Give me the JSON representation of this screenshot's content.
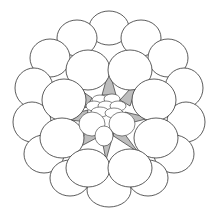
{
  "figure": {
    "colors": {
      "background": "#ffffff",
      "stroke": "#333333",
      "shading": "#bdbdbd"
    },
    "layout": {
      "center": [
        109,
        108
      ],
      "outer_ring_cells": 16,
      "middle_ring_cells": 8,
      "shaded_wedges": 8
    }
  }
}
